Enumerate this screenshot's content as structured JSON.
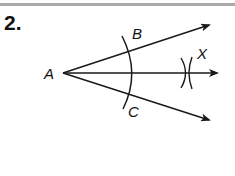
{
  "problem": {
    "number": "2."
  },
  "figure": {
    "type": "angle-bisector-construction",
    "stroke_color": "#1a1a1a",
    "labels": {
      "vertex": "A",
      "upper_point": "B",
      "lower_point": "C",
      "bisector_point": "X"
    },
    "rays": [
      {
        "name": "ray-AB",
        "from": [
          63,
          73
        ],
        "to": [
          211,
          24
        ]
      },
      {
        "name": "ray-AX",
        "from": [
          63,
          73
        ],
        "to": [
          219,
          73
        ]
      },
      {
        "name": "ray-AC",
        "from": [
          63,
          73
        ],
        "to": [
          211,
          121
        ]
      }
    ],
    "arc": {
      "center": [
        63,
        73
      ],
      "radius": 68
    },
    "cross_mark_center": [
      188,
      73
    ]
  },
  "colors": {
    "rule": "#a9a9a9",
    "ink": "#111111"
  }
}
